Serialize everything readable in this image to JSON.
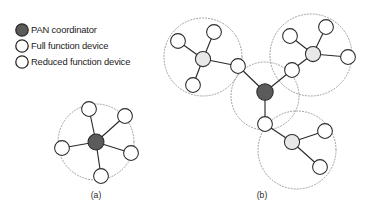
{
  "figure": {
    "width": 371,
    "height": 216,
    "background": "#ffffff"
  },
  "legend": {
    "items": [
      {
        "id": "pan-coordinator",
        "label": "PAN coordinator",
        "marker": "filled-dark-circle",
        "color": "#5b5b5b",
        "stroke": "#2b2b2b",
        "x": 22,
        "y": 30,
        "r": 6.2
      },
      {
        "id": "full-function",
        "label": "Full function device",
        "marker": "open-circle",
        "color": "#ffffff",
        "stroke": "#2b2b2b",
        "x": 22,
        "y": 46,
        "r": 6.2
      },
      {
        "id": "reduced-function",
        "label": "Reduced function device",
        "marker": "open-circle",
        "color": "#ffffff",
        "stroke": "#2b2b2b",
        "x": 22,
        "y": 62,
        "r": 6.2
      }
    ],
    "text_x": 31
  },
  "panels": [
    {
      "id": "a",
      "caption": "(a)",
      "caption_x": 96,
      "caption_y": 198,
      "topology": "star"
    },
    {
      "id": "b",
      "caption": "(b)",
      "caption_x": 262,
      "caption_y": 198,
      "topology": "cluster-tree"
    }
  ],
  "colors": {
    "coordinator_fill": "#5b5b5b",
    "full_function_fill": "#e8e8e8",
    "reduced_function_fill": "#ffffff",
    "node_stroke": "#2b2b2b",
    "edge": "#2b2b2b",
    "cluster_ring": "#8d8d8d",
    "text": "#1b1b1b"
  },
  "diagram_a": {
    "rings": [
      {
        "cx": 96,
        "cy": 142,
        "r": 38
      }
    ],
    "nodes": [
      {
        "id": "a-pan",
        "type": "coordinator",
        "cx": 96,
        "cy": 142,
        "r": 8.0
      },
      {
        "id": "a-n1",
        "type": "reduced",
        "cx": 89,
        "cy": 109,
        "r": 7.4
      },
      {
        "id": "a-n2",
        "type": "reduced",
        "cx": 125,
        "cy": 116,
        "r": 7.4
      },
      {
        "id": "a-n3",
        "type": "reduced",
        "cx": 131,
        "cy": 153,
        "r": 7.4
      },
      {
        "id": "a-n4",
        "type": "reduced",
        "cx": 101,
        "cy": 176,
        "r": 7.4
      },
      {
        "id": "a-n5",
        "type": "reduced",
        "cx": 62,
        "cy": 148,
        "r": 7.4
      }
    ],
    "edges": [
      [
        "a-pan",
        "a-n1"
      ],
      [
        "a-pan",
        "a-n2"
      ],
      [
        "a-pan",
        "a-n3"
      ],
      [
        "a-pan",
        "a-n4"
      ],
      [
        "a-pan",
        "a-n5"
      ]
    ]
  },
  "diagram_b": {
    "rings": [
      {
        "cx": 203,
        "cy": 57,
        "r": 39
      },
      {
        "cx": 311,
        "cy": 55,
        "r": 41
      },
      {
        "cx": 265,
        "cy": 96,
        "r": 34
      },
      {
        "cx": 297,
        "cy": 150,
        "r": 39
      }
    ],
    "nodes": [
      {
        "id": "b-pan",
        "type": "coordinator",
        "cx": 265,
        "cy": 92,
        "r": 8.2
      },
      {
        "id": "b-r1",
        "type": "reduced",
        "cx": 238,
        "cy": 66,
        "r": 7.4
      },
      {
        "id": "b-r2",
        "type": "reduced",
        "cx": 292,
        "cy": 70,
        "r": 7.4
      },
      {
        "id": "b-r3",
        "type": "reduced",
        "cx": 265,
        "cy": 124,
        "r": 7.4
      },
      {
        "id": "b-h1",
        "type": "full",
        "cx": 203,
        "cy": 59,
        "r": 7.6
      },
      {
        "id": "b-h1a",
        "type": "reduced",
        "cx": 178,
        "cy": 41,
        "r": 7.4
      },
      {
        "id": "b-h1b",
        "type": "reduced",
        "cx": 214,
        "cy": 32,
        "r": 7.4
      },
      {
        "id": "b-h1c",
        "type": "reduced",
        "cx": 193,
        "cy": 85,
        "r": 7.4
      },
      {
        "id": "b-h2",
        "type": "full",
        "cx": 313,
        "cy": 54,
        "r": 7.6
      },
      {
        "id": "b-h2a",
        "type": "reduced",
        "cx": 290,
        "cy": 36,
        "r": 7.4
      },
      {
        "id": "b-h2b",
        "type": "reduced",
        "cx": 326,
        "cy": 27,
        "r": 7.4
      },
      {
        "id": "b-h2c",
        "type": "reduced",
        "cx": 348,
        "cy": 57,
        "r": 7.4
      },
      {
        "id": "b-h3",
        "type": "full",
        "cx": 292,
        "cy": 142,
        "r": 7.6
      },
      {
        "id": "b-h3a",
        "type": "reduced",
        "cx": 325,
        "cy": 131,
        "r": 7.4
      },
      {
        "id": "b-h3b",
        "type": "reduced",
        "cx": 320,
        "cy": 167,
        "r": 7.4
      }
    ],
    "edges": [
      [
        "b-pan",
        "b-r1"
      ],
      [
        "b-pan",
        "b-r2"
      ],
      [
        "b-pan",
        "b-r3"
      ],
      [
        "b-r1",
        "b-h1"
      ],
      [
        "b-h1",
        "b-h1a"
      ],
      [
        "b-h1",
        "b-h1b"
      ],
      [
        "b-h1",
        "b-h1c"
      ],
      [
        "b-r2",
        "b-h2"
      ],
      [
        "b-h2",
        "b-h2a"
      ],
      [
        "b-h2",
        "b-h2b"
      ],
      [
        "b-h2",
        "b-h2c"
      ],
      [
        "b-r3",
        "b-h3"
      ],
      [
        "b-h3",
        "b-h3a"
      ],
      [
        "b-h3",
        "b-h3b"
      ]
    ]
  }
}
